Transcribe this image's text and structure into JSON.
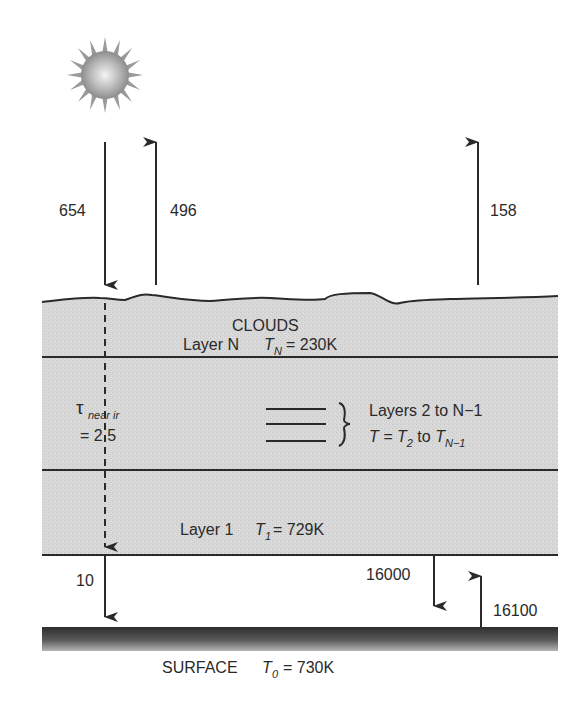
{
  "diagram": {
    "colors": {
      "background": "#ffffff",
      "cloud_fill": "#d6d6d6",
      "line": "#2a2a2a",
      "surface": "#3a3a3a",
      "sun_center": "#f2f2f2",
      "sun_edge": "#8a8a8a"
    },
    "icons": {
      "sun": "sun-icon"
    },
    "fluxes": {
      "solar_in": "654",
      "reflected_out": "496",
      "ir_out": "158",
      "surface_solar": "10",
      "atm_down_ir": "16000",
      "surface_up_ir": "16100"
    },
    "clouds": {
      "title": "CLOUDS",
      "layer_n": {
        "label": "Layer N",
        "temp_symbol": "T",
        "temp_sub": "N",
        "temp_value": "= 230K"
      },
      "middle": {
        "label": "Layers 2 to N−1",
        "temp_prefix": "T = ",
        "t2_symbol": "T",
        "t2_sub": "2",
        "to_word": " to ",
        "tn1_symbol": "T",
        "tn1_sub": "N−1"
      },
      "layer_1": {
        "label": "Layer 1",
        "temp_symbol": "T",
        "temp_sub": "1",
        "temp_value": "= 729K"
      },
      "optical_depth": {
        "symbol": "τ",
        "sub": "near ir",
        "value": "= 2.5"
      }
    },
    "surface": {
      "label": "SURFACE",
      "temp_symbol": "T",
      "temp_sub": "0",
      "temp_value": "= 730K"
    }
  }
}
